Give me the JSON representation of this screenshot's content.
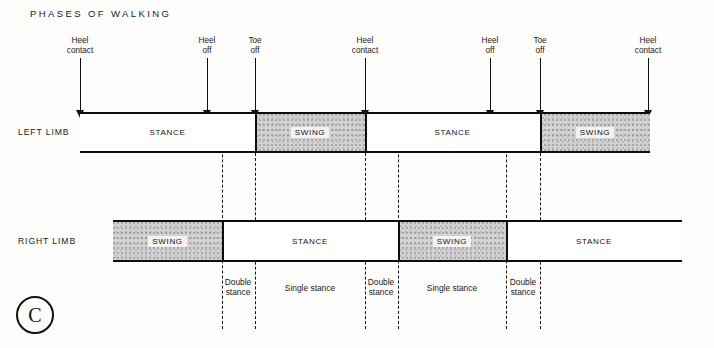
{
  "title": "PHASES OF WALKING",
  "copyright_symbol": "C",
  "colors": {
    "background": "#fdfdfc",
    "ink": "#111111",
    "bar_border": "#0d0d0d",
    "stance_fill": "#ffffff",
    "swing_fill": "#d2d2d2"
  },
  "events": [
    {
      "name": "heel-contact-1",
      "label": "Heel\ncontact",
      "x": 80,
      "shaft_top": 22,
      "shaft_height": 52
    },
    {
      "name": "heel-off-1",
      "label": "Heel\noff",
      "x": 207,
      "shaft_top": 22,
      "shaft_height": 52
    },
    {
      "name": "toe-off-1",
      "label": "Toe\noff",
      "x": 255,
      "shaft_top": 22,
      "shaft_height": 52
    },
    {
      "name": "heel-contact-2",
      "label": "Heel\ncontact",
      "x": 365,
      "shaft_top": 22,
      "shaft_height": 52
    },
    {
      "name": "heel-off-2",
      "label": "Heel\noff",
      "x": 490,
      "shaft_top": 22,
      "shaft_height": 52
    },
    {
      "name": "toe-off-2",
      "label": "Toe\noff",
      "x": 540,
      "shaft_top": 22,
      "shaft_height": 52
    },
    {
      "name": "heel-contact-3",
      "label": "Heel\ncontact",
      "x": 648,
      "shaft_top": 22,
      "shaft_height": 52
    }
  ],
  "limbs": [
    {
      "name": "left-limb",
      "label": "LEFT LIMB",
      "label_x": 18,
      "label_y": 127,
      "bar": {
        "x": 80,
        "y": 112,
        "width": 570,
        "height": 41
      },
      "segments": [
        {
          "name": "left-stance-1",
          "phase": "STANCE",
          "type": "stance",
          "start": 80,
          "end": 255
        },
        {
          "name": "left-swing-1",
          "phase": "SWING",
          "type": "swing",
          "start": 255,
          "end": 365
        },
        {
          "name": "left-stance-2",
          "phase": "STANCE",
          "type": "stance",
          "start": 365,
          "end": 540
        },
        {
          "name": "left-swing-2",
          "phase": "SWING",
          "type": "swing",
          "start": 540,
          "end": 650
        }
      ]
    },
    {
      "name": "right-limb",
      "label": "RIGHT LIMB",
      "label_x": 18,
      "label_y": 236,
      "bar": {
        "x": 113,
        "y": 220,
        "width": 569,
        "height": 42
      },
      "segments": [
        {
          "name": "right-swing-1",
          "phase": "SWING",
          "type": "swing",
          "start": 113,
          "end": 222
        },
        {
          "name": "right-stance-1",
          "phase": "STANCE",
          "type": "stance",
          "start": 222,
          "end": 398
        },
        {
          "name": "right-swing-2",
          "phase": "SWING",
          "type": "swing",
          "start": 398,
          "end": 506
        },
        {
          "name": "right-stance-2",
          "phase": "STANCE",
          "type": "stance",
          "start": 506,
          "end": 682
        }
      ]
    }
  ],
  "dashed_lines": [
    {
      "name": "dash-heel-off-1",
      "x": 222,
      "top": 114,
      "height": 215
    },
    {
      "name": "dash-toe-off-1",
      "x": 255,
      "top": 153,
      "height": 176
    },
    {
      "name": "dash-heel-contact-2",
      "x": 365,
      "top": 153,
      "height": 176
    },
    {
      "name": "dash-heel-off-2a",
      "x": 398,
      "top": 114,
      "height": 215
    },
    {
      "name": "dash-heel-off-3",
      "x": 506,
      "top": 114,
      "height": 215
    },
    {
      "name": "dash-toe-off-2",
      "x": 540,
      "top": 153,
      "height": 176
    }
  ],
  "phase_annotations": [
    {
      "name": "double-stance-1",
      "label": "Double\nstance",
      "center": 238,
      "top": 277
    },
    {
      "name": "single-stance-1",
      "label": "Single stance",
      "center": 310,
      "top": 283
    },
    {
      "name": "double-stance-2",
      "label": "Double\nstance",
      "center": 381,
      "top": 277
    },
    {
      "name": "single-stance-2",
      "label": "Single stance",
      "center": 452,
      "top": 283
    },
    {
      "name": "double-stance-3",
      "label": "Double\nstance",
      "center": 523,
      "top": 277
    }
  ]
}
